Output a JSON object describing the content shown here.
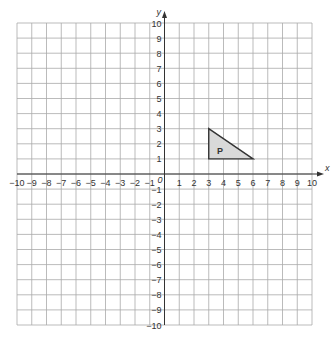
{
  "diagram": {
    "type": "coordinate-grid",
    "x_axis": {
      "label": "x",
      "min": -10,
      "max": 10,
      "step": 1
    },
    "y_axis": {
      "label": "y",
      "min": -10,
      "max": 10,
      "step": 1
    },
    "origin_label": "0",
    "x_tick_labels": [
      "−10",
      "−9",
      "−8",
      "−7",
      "−6",
      "−5",
      "−4",
      "−3",
      "−2",
      "−1",
      "1",
      "2",
      "3",
      "4",
      "5",
      "6",
      "7",
      "8",
      "9",
      "10"
    ],
    "y_tick_labels": [
      "10",
      "9",
      "8",
      "7",
      "6",
      "5",
      "4",
      "3",
      "2",
      "1",
      "−1",
      "−2",
      "−3",
      "−4",
      "−5",
      "−6",
      "−7",
      "−8",
      "−9",
      "−10"
    ],
    "shapes": [
      {
        "name": "P",
        "kind": "triangle",
        "vertices": [
          [
            3,
            3
          ],
          [
            3,
            1
          ],
          [
            6,
            1
          ]
        ],
        "fill": "#d9d9d9",
        "stroke": "#333333"
      }
    ],
    "colors": {
      "grid": "#aaaaaa",
      "axis": "#333333",
      "background": "#ffffff"
    }
  }
}
